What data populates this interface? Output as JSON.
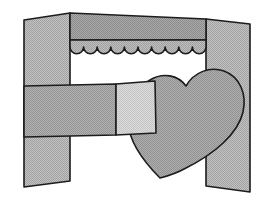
{
  "illustration": {
    "title": "Heart and bed frame line drawing",
    "canvas": {
      "width": 272,
      "height": 206,
      "background": "#ffffff"
    },
    "style": {
      "outline_color": "#1c1c1c",
      "outline_width": 1.6,
      "shading": "dithered halftone grays"
    },
    "palette": {
      "post_light": "#b4b4b4",
      "post_mid": "#a8a8a8",
      "valance_dark": "#9a9a9a",
      "valance_light": "#b0b0b0",
      "rail_dark": "#a2a2a2",
      "rail_light": "#cfcfcf",
      "heart_fill": "#a0a0a0",
      "background": "#ffffff"
    },
    "parts": [
      {
        "name": "left-post",
        "label": "Left vertical post",
        "fill": "#b4b4b4",
        "description": "Tall vertical column running from top edge to bottom edge at the left side"
      },
      {
        "name": "right-post",
        "label": "Right vertical post",
        "fill": "#b4b4b4",
        "description": "Tall vertical column at the right side, partly hidden behind the heart"
      },
      {
        "name": "valance-band",
        "label": "Upper valance band",
        "fill": "#9a9a9a",
        "description": "Horizontal band spanning between the two posts at the top"
      },
      {
        "name": "valance-scallop",
        "label": "Scalloped valance fringe",
        "fill": "#b0b0b0",
        "scallop_count": 10,
        "description": "Row of half-circle scallops along the lower edge of the valance"
      },
      {
        "name": "rail-dark-segment",
        "label": "Horizontal rail, left segment",
        "fill": "#a2a2a2",
        "description": "Darker left portion of the horizontal cross rail"
      },
      {
        "name": "rail-light-segment",
        "label": "Horizontal rail, right segment",
        "fill": "#cfcfcf",
        "description": "Lighter right portion of the rail that overlaps the heart"
      },
      {
        "name": "heart",
        "label": "Heart shape",
        "fill": "#a0a0a0",
        "description": "Large tilted heart overlapping the right post and the rail"
      }
    ]
  }
}
